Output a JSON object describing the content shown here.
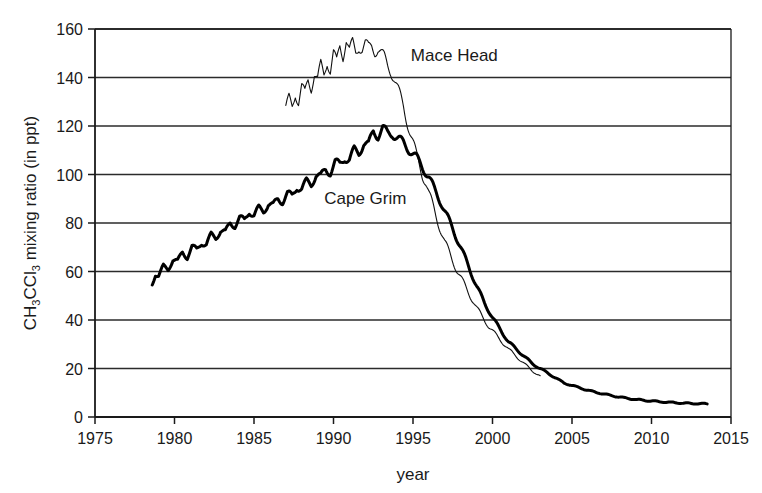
{
  "chart_data": {
    "type": "line",
    "title": "",
    "subtitle": "",
    "xlabel": "year",
    "ylabel": "CH3CCl3 mixing ratio (in ppt)",
    "ylabel_parts": {
      "p1": "CH",
      "sub1": "3",
      "p2": "CCl",
      "sub2": "3",
      "p3": " mixing ratio (in ppt)"
    },
    "xlim": [
      1975,
      2015
    ],
    "ylim": [
      0,
      160
    ],
    "xticks": [
      1975,
      1980,
      1985,
      1990,
      1995,
      2000,
      2005,
      2010,
      2015
    ],
    "yticks": [
      0,
      20,
      40,
      60,
      80,
      100,
      120,
      140,
      160
    ],
    "grid": "horizontal",
    "legend_position": "inline-annotations",
    "annotations": [
      {
        "text": "Mace Head",
        "x": 1997.6,
        "y": 147,
        "series": "Mace Head"
      },
      {
        "text": "Cape Grim",
        "x": 1992.0,
        "y": 88,
        "series": "Cape Grim"
      }
    ],
    "series": [
      {
        "name": "Mace Head",
        "style": "thin",
        "color": "#111111",
        "linewidth": 1.1,
        "x": [
          1987.0,
          1987.2,
          1987.4,
          1987.6,
          1987.8,
          1988.0,
          1988.2,
          1988.4,
          1988.6,
          1988.8,
          1989.0,
          1989.2,
          1989.4,
          1989.6,
          1989.8,
          1990.0,
          1990.2,
          1990.4,
          1990.6,
          1990.8,
          1991.0,
          1991.2,
          1991.4,
          1991.6,
          1991.8,
          1992.0,
          1992.2,
          1992.4,
          1992.6,
          1992.8,
          1993.0,
          1993.2,
          1993.4,
          1993.6,
          1993.8,
          1994.0,
          1994.2,
          1994.4,
          1994.6,
          1994.8,
          1995.0,
          1995.2,
          1995.4,
          1995.6,
          1995.8,
          1996.0,
          1996.2,
          1996.4,
          1996.6,
          1996.8,
          1997.0,
          1997.4,
          1997.8,
          1998.2,
          1998.6,
          1999.0,
          1999.4,
          1999.8,
          2000.2,
          2000.6,
          2001.0,
          2001.5,
          2002.0,
          2002.5,
          2003.0
        ],
        "y": [
          127,
          131,
          128,
          134,
          130,
          136,
          133,
          139,
          136,
          142,
          139,
          145,
          141,
          147,
          143,
          150,
          146,
          153,
          149,
          156,
          151,
          154,
          150,
          153,
          152,
          154,
          152,
          153,
          151,
          152,
          150,
          148,
          145,
          143,
          140,
          136,
          132,
          128,
          123,
          118,
          113,
          108,
          104,
          100,
          97,
          92,
          88,
          84,
          80,
          76,
          72,
          66,
          60,
          55,
          50,
          45,
          41,
          37,
          34,
          31,
          28,
          25,
          22,
          19,
          17
        ]
      },
      {
        "name": "Cape Grim",
        "style": "thick",
        "color": "#000000",
        "linewidth": 3.0,
        "x": [
          1978.6,
          1978.8,
          1979.0,
          1979.3,
          1979.6,
          1979.9,
          1980.2,
          1980.5,
          1980.8,
          1981.1,
          1981.4,
          1981.7,
          1982.0,
          1982.3,
          1982.6,
          1982.9,
          1983.2,
          1983.5,
          1983.8,
          1984.1,
          1984.4,
          1984.7,
          1985.0,
          1985.3,
          1985.6,
          1985.9,
          1986.2,
          1986.5,
          1986.8,
          1987.1,
          1987.4,
          1987.7,
          1988.0,
          1988.3,
          1988.6,
          1988.9,
          1989.2,
          1989.5,
          1989.8,
          1990.1,
          1990.4,
          1990.7,
          1991.0,
          1991.3,
          1991.6,
          1991.9,
          1992.2,
          1992.5,
          1992.8,
          1993.1,
          1993.4,
          1993.7,
          1994.0,
          1994.4,
          1994.8,
          1995.2,
          1995.6,
          1996.0,
          1996.4,
          1996.8,
          1997.2,
          1997.6,
          1998.0,
          1998.5,
          1999.0,
          1999.5,
          2000.0,
          2000.5,
          2001.0,
          2001.5,
          2002.0,
          2002.5,
          2003.0,
          2003.5,
          2004.0,
          2004.5,
          2005.0,
          2005.5,
          2006.0,
          2006.5,
          2007.0,
          2007.5,
          2008.0,
          2008.5,
          2009.0,
          2009.5,
          2010.0,
          2010.5,
          2011.0,
          2011.5,
          2012.0,
          2012.5,
          2013.0,
          2013.5
        ],
        "y": [
          55,
          59,
          58,
          62,
          61,
          65,
          64,
          68,
          66,
          70,
          69,
          72,
          71,
          75,
          74,
          77,
          76,
          80,
          79,
          82,
          81,
          85,
          83,
          86,
          85,
          88,
          87,
          90,
          89,
          92,
          91,
          95,
          94,
          97,
          96,
          100,
          99,
          102,
          101,
          105,
          104,
          107,
          106,
          110,
          109,
          113,
          112,
          118,
          116,
          119,
          117,
          117,
          115,
          113,
          110,
          107,
          103,
          99,
          93,
          88,
          82,
          76,
          70,
          62,
          54,
          47,
          41,
          36,
          31,
          28,
          25,
          22,
          20,
          18,
          16,
          14,
          13,
          12,
          11,
          10.2,
          9.5,
          8.8,
          8.2,
          7.7,
          7.2,
          6.9,
          6.6,
          6.3,
          6.1,
          5.9,
          5.7,
          5.6,
          5.5,
          5.4
        ]
      }
    ]
  },
  "axes": {
    "x_tick_labels": [
      "1975",
      "1980",
      "1985",
      "1990",
      "1995",
      "2000",
      "2005",
      "2010",
      "2015"
    ],
    "y_tick_labels": [
      "0",
      "20",
      "40",
      "60",
      "80",
      "100",
      "120",
      "140",
      "160"
    ]
  },
  "colors": {
    "axis": "#1a1a1a",
    "grid": "#2b2b2b",
    "background": "#ffffff"
  }
}
